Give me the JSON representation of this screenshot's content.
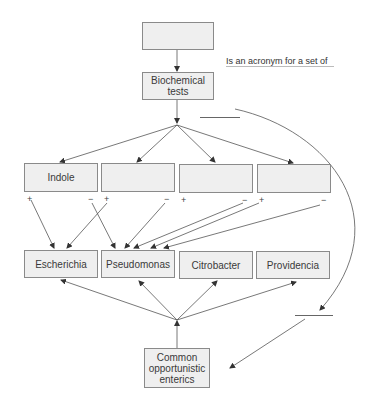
{
  "diagram": {
    "top_box": {
      "label": ""
    },
    "acronym_label": "Is an acronym for a set of",
    "tests_box": {
      "label": "Biochemical tests"
    },
    "test_boxes": [
      {
        "label": "Indole",
        "plus": "+",
        "minus": "−"
      },
      {
        "label": "",
        "plus": "+",
        "minus": "−"
      },
      {
        "label": "",
        "plus": "+",
        "minus": "−"
      },
      {
        "label": "",
        "plus": "+",
        "minus": "−"
      }
    ],
    "genus_boxes": [
      {
        "label": "Escherichia"
      },
      {
        "label": "Pseudomonas"
      },
      {
        "label": "Citrobacter"
      },
      {
        "label": "Providencia"
      }
    ],
    "bottom_box": {
      "label": "Common opportunistic enterics"
    },
    "colors": {
      "box_fill": "#efefef",
      "box_border": "#8a8a8a",
      "line": "#555555"
    }
  }
}
